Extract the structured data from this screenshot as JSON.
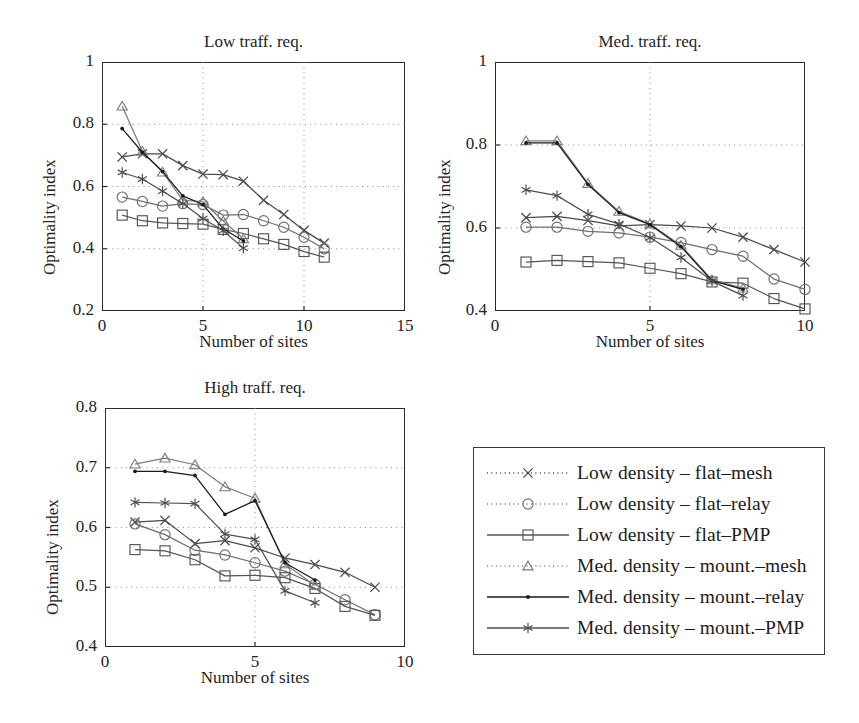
{
  "figure": {
    "background": "#ffffff",
    "ink": "#2b2b2b",
    "panel_titles": [
      "Low traff. req.",
      "Med. traff. req.",
      "High traff. req."
    ],
    "axis_label_x": "Number of sites",
    "axis_label_y": "Optimality index",
    "top_fragment": ""
  },
  "legend": {
    "position": "bottom-right",
    "entries": [
      {
        "label": "Low density – flat–mesh",
        "marker": "cross-marker",
        "glyph": "x",
        "color": "#4a4a4a",
        "linestyle": "dotted"
      },
      {
        "label": "Low density – flat–relay",
        "marker": "circle-marker",
        "glyph": "circle",
        "color": "#6e6e6e",
        "linestyle": "dotted"
      },
      {
        "label": "Low density – flat–PMP",
        "marker": "square-marker",
        "glyph": "square",
        "color": "#555555",
        "linestyle": "solid"
      },
      {
        "label": "Med. density – mount.–mesh",
        "marker": "triangle-marker",
        "glyph": "triangle",
        "color": "#7d7d7d",
        "linestyle": "dotted"
      },
      {
        "label": "Med. density – mount.–relay",
        "marker": "dot-marker",
        "glyph": "dot",
        "color": "#1a1a1a",
        "linestyle": "solid"
      },
      {
        "label": "Med. density – mount.–PMP",
        "marker": "asterisk-marker",
        "glyph": "asterisk",
        "color": "#4f4f4f",
        "linestyle": "solid"
      }
    ]
  },
  "chart_data": [
    {
      "id": "low-traffic",
      "type": "line",
      "title": "Low traff. req.",
      "xlabel": "Number of sites",
      "ylabel": "Optimality index",
      "xlim": [
        0,
        15
      ],
      "ylim": [
        0.2,
        1
      ],
      "xticks": [
        0,
        5,
        10,
        15
      ],
      "yticks": [
        0.2,
        0.4,
        0.6,
        0.8,
        1
      ],
      "ytick_labels": [
        "0.2",
        "0.4",
        "0.6",
        "0.8",
        "1"
      ],
      "grid": "dotted",
      "series": [
        {
          "name": "Low density – flat–mesh",
          "x": [
            1,
            2,
            3,
            4,
            5,
            6,
            7,
            8,
            9,
            10,
            11
          ],
          "values": [
            0.695,
            0.705,
            0.705,
            0.667,
            0.64,
            0.638,
            0.617,
            0.556,
            0.51,
            0.459,
            0.418
          ]
        },
        {
          "name": "Low density – flat–relay",
          "x": [
            1,
            2,
            3,
            4,
            5,
            6,
            7,
            8,
            9,
            10,
            11
          ],
          "values": [
            0.566,
            0.552,
            0.537,
            0.545,
            0.542,
            0.508,
            0.51,
            0.49,
            0.469,
            0.437,
            0.4
          ]
        },
        {
          "name": "Low density – flat–PMP",
          "x": [
            1,
            2,
            3,
            4,
            5,
            6,
            7,
            8,
            9,
            10,
            11
          ],
          "values": [
            0.508,
            0.49,
            0.483,
            0.481,
            0.479,
            0.462,
            0.449,
            0.432,
            0.414,
            0.391,
            0.373
          ]
        },
        {
          "name": "Med. density – mount.–mesh",
          "x": [
            1,
            2,
            3,
            4,
            5,
            6,
            7,
            8,
            9,
            10,
            11
          ],
          "values": [
            0.858,
            0.713,
            0.646,
            0.556,
            0.551,
            0.489,
            0.432,
            0.0,
            0.0,
            0.0,
            0.0
          ]
        },
        {
          "name": "Med. density – mount.–relay",
          "x": [
            1,
            2,
            3,
            4,
            5,
            6,
            7
          ],
          "values": [
            0.786,
            0.71,
            0.648,
            0.57,
            0.542,
            0.464,
            0.425
          ]
        },
        {
          "name": "Med. density – mount.–PMP",
          "x": [
            1,
            2,
            3,
            4,
            5,
            6,
            7
          ],
          "values": [
            0.645,
            0.624,
            0.585,
            0.545,
            0.497,
            0.458,
            0.402
          ]
        }
      ]
    },
    {
      "id": "med-traffic",
      "type": "line",
      "title": "Med. traff. req.",
      "xlabel": "Number of sites",
      "ylabel": "Optimality index",
      "xlim": [
        0,
        10
      ],
      "ylim": [
        0.4,
        1
      ],
      "xticks": [
        0,
        5,
        10
      ],
      "yticks": [
        0.4,
        0.6,
        0.8,
        1
      ],
      "ytick_labels": [
        "0.4",
        "0.6",
        "0.8",
        "1"
      ],
      "grid": "dotted",
      "series": [
        {
          "name": "Low density – flat–mesh",
          "x": [
            1,
            2,
            3,
            4,
            5,
            6,
            7,
            8,
            9,
            10
          ],
          "values": [
            0.625,
            0.628,
            0.618,
            0.605,
            0.608,
            0.605,
            0.6,
            0.578,
            0.548,
            0.518
          ]
        },
        {
          "name": "Low density – flat–relay",
          "x": [
            1,
            2,
            3,
            4,
            5,
            6,
            7,
            8,
            9,
            10
          ],
          "values": [
            0.602,
            0.602,
            0.592,
            0.588,
            0.578,
            0.565,
            0.548,
            0.532,
            0.477,
            0.452
          ]
        },
        {
          "name": "Low density – flat–PMP",
          "x": [
            1,
            2,
            3,
            4,
            5,
            6,
            7,
            8,
            9,
            10
          ],
          "values": [
            0.518,
            0.522,
            0.519,
            0.516,
            0.503,
            0.49,
            0.47,
            0.467,
            0.43,
            0.405
          ]
        },
        {
          "name": "Med. density – mount.–mesh",
          "x": [
            1,
            2,
            3,
            4,
            5,
            6,
            7,
            8
          ],
          "values": [
            0.81,
            0.81,
            0.707,
            0.64,
            0.61,
            0.558,
            0.475,
            0.455
          ]
        },
        {
          "name": "Med. density – mount.–relay",
          "x": [
            1,
            2,
            3,
            4,
            5,
            6,
            7,
            8
          ],
          "values": [
            0.805,
            0.805,
            0.705,
            0.637,
            0.608,
            0.555,
            0.473,
            0.452
          ]
        },
        {
          "name": "Med. density – mount.–PMP",
          "x": [
            1,
            2,
            3,
            4,
            5,
            6,
            7,
            8
          ],
          "values": [
            0.692,
            0.678,
            0.633,
            0.61,
            0.577,
            0.529,
            0.472,
            0.437
          ]
        }
      ]
    },
    {
      "id": "high-traffic",
      "type": "line",
      "title": "High traff. req.",
      "xlabel": "Number of sites",
      "ylabel": "Optimality index",
      "xlim": [
        0,
        10
      ],
      "ylim": [
        0.4,
        0.8
      ],
      "xticks": [
        0,
        5,
        10
      ],
      "yticks": [
        0.4,
        0.5,
        0.6,
        0.7,
        0.8
      ],
      "ytick_labels": [
        "0.4",
        "0.5",
        "0.6",
        "0.7",
        "0.8"
      ],
      "grid": "dotted",
      "series": [
        {
          "name": "Low density – flat–mesh",
          "x": [
            1,
            2,
            3,
            4,
            5,
            6,
            7,
            8,
            9
          ],
          "values": [
            0.609,
            0.612,
            0.573,
            0.578,
            0.566,
            0.549,
            0.538,
            0.525,
            0.5
          ]
        },
        {
          "name": "Low density – flat–relay",
          "x": [
            1,
            2,
            3,
            4,
            5,
            6,
            7,
            8,
            9
          ],
          "values": [
            0.606,
            0.588,
            0.562,
            0.554,
            0.541,
            0.527,
            0.505,
            0.479,
            0.454
          ]
        },
        {
          "name": "Low density – flat–PMP",
          "x": [
            1,
            2,
            3,
            4,
            5,
            6,
            7,
            8,
            9
          ],
          "values": [
            0.563,
            0.561,
            0.546,
            0.519,
            0.52,
            0.516,
            0.498,
            0.468,
            0.453
          ]
        },
        {
          "name": "Med. density – mount.–mesh",
          "x": [
            1,
            2,
            3,
            4,
            5,
            6,
            7
          ],
          "values": [
            0.706,
            0.716,
            0.705,
            0.668,
            0.649,
            0.539,
            0.503
          ]
        },
        {
          "name": "Med. density – mount.–relay",
          "x": [
            1,
            2,
            3,
            4,
            5,
            6,
            7
          ],
          "values": [
            0.694,
            0.694,
            0.687,
            0.622,
            0.645,
            0.541,
            0.512
          ]
        },
        {
          "name": "Med. density – mount.–PMP",
          "x": [
            1,
            2,
            3,
            4,
            5,
            6,
            7
          ],
          "values": [
            0.642,
            0.641,
            0.64,
            0.589,
            0.58,
            0.494,
            0.474
          ]
        }
      ]
    }
  ]
}
